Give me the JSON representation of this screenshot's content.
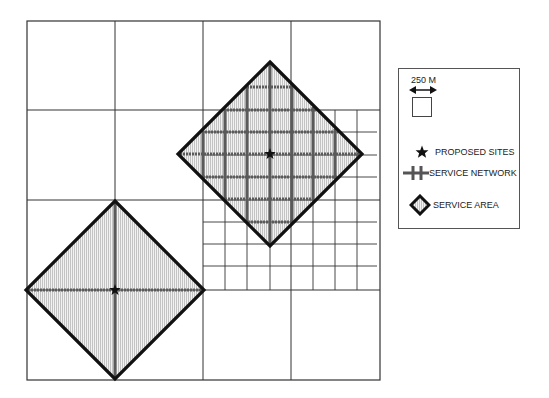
{
  "diagram": {
    "type": "service-area-grid-map",
    "outer_frame": {
      "x1": 27,
      "y1": 21,
      "x2": 380,
      "y2": 380
    },
    "coarse_grid": {
      "vertical_x": [
        115,
        203,
        291
      ],
      "horizontal_y": [
        110,
        200,
        290
      ]
    },
    "fine_grid": {
      "region": {
        "x1": 203,
        "y1": 110,
        "x2": 380,
        "y2": 290
      },
      "vertical_x": [
        225,
        247,
        270,
        313,
        335,
        357
      ],
      "horizontal_y": [
        132,
        155,
        177,
        222,
        244,
        266
      ]
    },
    "service_areas": [
      {
        "name": "upper-right-site",
        "center": [
          270,
          154
        ],
        "half_diagonal": 92,
        "network_lines_vertical_x": [
          203,
          225,
          247,
          270,
          292,
          313,
          335
        ],
        "network_lines_horizontal_y": [
          87,
          110,
          132,
          154,
          177,
          199,
          222
        ]
      },
      {
        "name": "lower-left-site",
        "center": [
          115,
          290
        ],
        "half_diagonal": 89,
        "network_lines_vertical_x": [
          115
        ],
        "network_lines_horizontal_y": [
          290
        ]
      }
    ],
    "colors": {
      "grid": "#333333",
      "area_border": "#111111",
      "network": "#5a5a5a",
      "hatch": "#bdbdbd",
      "star": "#111111"
    }
  },
  "legend": {
    "scale_label": "250 M",
    "scale_icon": "double-arrow-icon",
    "items": [
      {
        "icon": "star-icon",
        "label": "PROPOSED SITES"
      },
      {
        "icon": "network-line-icon",
        "label": "SERVICE NETWORK"
      },
      {
        "icon": "diamond-area-icon",
        "label": "SERVICE AREA"
      }
    ]
  }
}
